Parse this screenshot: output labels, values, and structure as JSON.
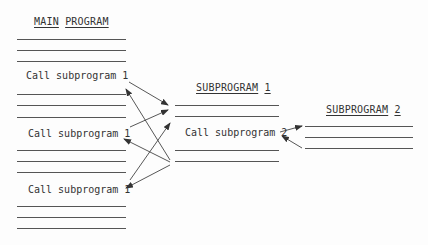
{
  "main_program": {
    "title_words": [
      "MAIN",
      "PROGRAM"
    ],
    "calls": [
      "Call subprogram 1",
      "Call subprogram 1",
      "Call subprogram 1"
    ]
  },
  "subprogram1": {
    "title_words": [
      "SUBPROGRAM",
      "1"
    ],
    "call": "Call subprogram 2"
  },
  "subprogram2": {
    "title_words": [
      "SUBPROGRAM",
      "2"
    ]
  },
  "colors": {
    "line": "#555555",
    "text": "#333333",
    "background": "#fdfdfd"
  }
}
